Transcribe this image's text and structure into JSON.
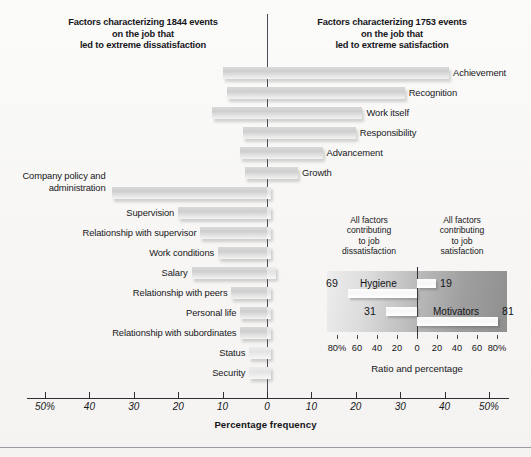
{
  "headers": {
    "left": [
      "Factors characterizing 1844 events",
      "on the job that",
      "led to extreme dissatisfaction"
    ],
    "right": [
      "Factors characterizing 1753 events",
      "on the job that",
      "led to extreme satisfaction"
    ]
  },
  "axis": {
    "title": "Percentage frequency",
    "tick_labels": [
      "50%",
      "40",
      "30",
      "20",
      "10",
      "0",
      "10",
      "20",
      "30",
      "40",
      "50%"
    ],
    "tick_values": [
      -50,
      -40,
      -30,
      -20,
      -10,
      0,
      10,
      20,
      30,
      40,
      50
    ]
  },
  "inset": {
    "header_left": [
      "All factors",
      "contributing",
      "to job",
      "dissatisfaction"
    ],
    "header_right": [
      "All factors",
      "contributing",
      "to job",
      "satisfaction"
    ],
    "rows": [
      {
        "name": "Hygiene",
        "left_value": "69",
        "right_value": "19"
      },
      {
        "name": "Motivators",
        "left_value": "31",
        "right_value": "81"
      }
    ],
    "axis_title": "Ratio and percentage",
    "tick_labels": [
      "80%",
      "60",
      "40",
      "20",
      "0",
      "20",
      "40",
      "60",
      "80%"
    ],
    "tick_values": [
      -80,
      -60,
      -40,
      -20,
      0,
      20,
      40,
      60,
      80
    ]
  },
  "chart_data": {
    "type": "bar",
    "orientation": "horizontal-diverging",
    "xlabel": "Percentage frequency",
    "ylabel": "",
    "xlim": [
      -50,
      50
    ],
    "grid": false,
    "legend_position": "none",
    "series": [
      {
        "name": "Factors leading to extreme dissatisfaction",
        "side": "left"
      },
      {
        "name": "Factors leading to extreme satisfaction",
        "side": "right"
      }
    ],
    "categories": [
      "Achievement",
      "Recognition",
      "Work itself",
      "Responsibility",
      "Advancement",
      "Growth",
      "Company policy and administration",
      "Supervision",
      "Relationship with supervisor",
      "Work conditions",
      "Salary",
      "Relationship with peers",
      "Personal life",
      "Relationship with subordinates",
      "Status",
      "Security"
    ],
    "bars": [
      {
        "label": "Achievement",
        "label_side": "right",
        "dissatisfaction": 10.0,
        "satisfaction": 41.0,
        "group": "motivator"
      },
      {
        "label": "Recognition",
        "label_side": "right",
        "dissatisfaction": 9.0,
        "satisfaction": 31.0,
        "group": "motivator"
      },
      {
        "label": "Work itself",
        "label_side": "right",
        "dissatisfaction": 12.5,
        "satisfaction": 21.5,
        "group": "motivator"
      },
      {
        "label": "Responsibility",
        "label_side": "right",
        "dissatisfaction": 5.5,
        "satisfaction": 20.0,
        "group": "motivator"
      },
      {
        "label": "Advancement",
        "label_side": "right",
        "dissatisfaction": 6.0,
        "satisfaction": 12.5,
        "group": "motivator"
      },
      {
        "label": "Growth",
        "label_side": "right",
        "dissatisfaction": 5.0,
        "satisfaction": 7.0,
        "group": "motivator"
      },
      {
        "label": "Company policy and administration",
        "label_side": "left",
        "dissatisfaction": 35.0,
        "satisfaction": 1.0,
        "group": "hygiene"
      },
      {
        "label": "Supervision",
        "label_side": "left",
        "dissatisfaction": 20.0,
        "satisfaction": 1.0,
        "group": "hygiene"
      },
      {
        "label": "Relationship with supervisor",
        "label_side": "left",
        "dissatisfaction": 15.0,
        "satisfaction": 1.0,
        "group": "hygiene"
      },
      {
        "label": "Work conditions",
        "label_side": "left",
        "dissatisfaction": 11.0,
        "satisfaction": 1.0,
        "group": "hygiene"
      },
      {
        "label": "Salary",
        "label_side": "left",
        "dissatisfaction": 17.0,
        "satisfaction": 2.0,
        "group": "hygiene"
      },
      {
        "label": "Relationship with peers",
        "label_side": "left",
        "dissatisfaction": 8.0,
        "satisfaction": 1.0,
        "group": "hygiene"
      },
      {
        "label": "Personal life",
        "label_side": "left",
        "dissatisfaction": 6.0,
        "satisfaction": 1.0,
        "group": "hygiene"
      },
      {
        "label": "Relationship with subordinates",
        "label_side": "left",
        "dissatisfaction": 6.0,
        "satisfaction": 1.0,
        "group": "hygiene"
      },
      {
        "label": "Status",
        "label_side": "left",
        "dissatisfaction": 4.0,
        "satisfaction": 1.0,
        "group": "hygiene"
      },
      {
        "label": "Security",
        "label_side": "left",
        "dissatisfaction": 4.0,
        "satisfaction": 1.0,
        "group": "hygiene"
      }
    ],
    "inset_chart": {
      "type": "bar",
      "title": "Ratio and percentage",
      "xlim": [
        -80,
        80
      ],
      "rows": [
        {
          "name": "Hygiene",
          "dissatisfaction": 69,
          "satisfaction": 19
        },
        {
          "name": "Motivators",
          "dissatisfaction": 31,
          "satisfaction": 81
        }
      ]
    }
  },
  "colors": {
    "background": "#f7f6f4",
    "bar_fill": "#d6d6d6",
    "axis": "#2f2f35",
    "text": "#16161a",
    "inset_panel_dark": "#8f8f8f",
    "inset_panel_light": "#ededed"
  }
}
